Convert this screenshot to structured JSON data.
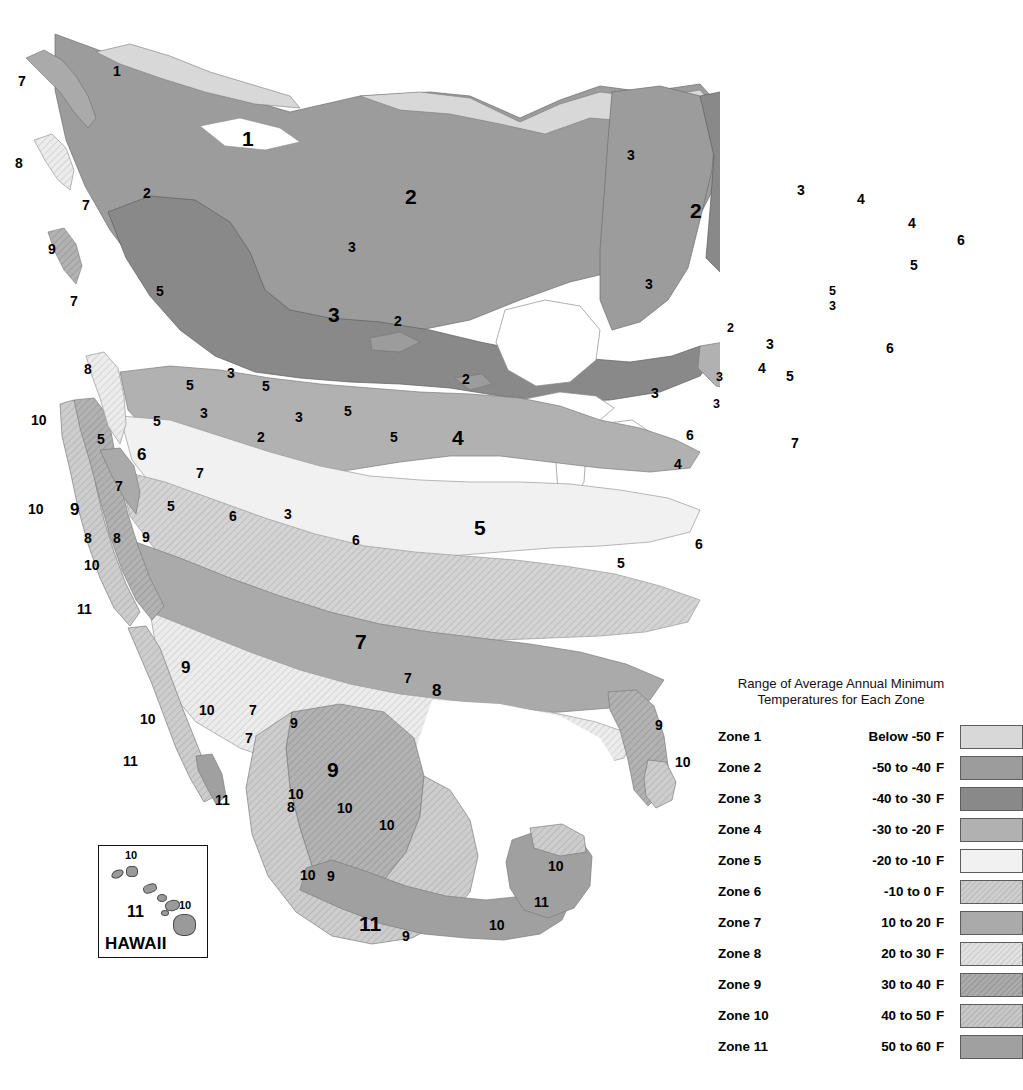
{
  "document": {
    "type": "usda-plant-hardiness-zone-map",
    "region": "North America"
  },
  "legend": {
    "title_line1": "Range of Average Annual Minimum",
    "title_line2": "Temperatures for Each Zone",
    "unit": "F",
    "rows": [
      {
        "zone": "Zone 1",
        "range": "Below -50",
        "unit": "F",
        "color": "#d8d8d8",
        "hatch": false
      },
      {
        "zone": "Zone 2",
        "range": "-50  to -40",
        "unit": "F",
        "color": "#9c9c9c",
        "hatch": false
      },
      {
        "zone": "Zone 3",
        "range": "-40  to -30",
        "unit": "F",
        "color": "#898989",
        "hatch": false
      },
      {
        "zone": "Zone 4",
        "range": "-30  to -20",
        "unit": "F",
        "color": "#b1b1b1",
        "hatch": false
      },
      {
        "zone": "Zone 5",
        "range": "-20  to -10",
        "unit": "F",
        "color": "#f1f1f1",
        "hatch": false
      },
      {
        "zone": "Zone 6",
        "range": "-10  to 0",
        "unit": "F",
        "color": "#cfcfcf",
        "hatch": true
      },
      {
        "zone": "Zone 7",
        "range": "10  to 20",
        "unit": "F",
        "color": "#aaaaaa",
        "hatch": false
      },
      {
        "zone": "Zone 8",
        "range": "20  to 30",
        "unit": "F",
        "color": "#e2e2e2",
        "hatch": true
      },
      {
        "zone": "Zone 9",
        "range": "30  to 40",
        "unit": "F",
        "color": "#acacac",
        "hatch": true
      },
      {
        "zone": "Zone 10",
        "range": "40  to 50",
        "unit": "F",
        "color": "#c8c8c8",
        "hatch": true
      },
      {
        "zone": "Zone 11",
        "range": "50  to 60",
        "unit": "F",
        "color": "#a0a0a0",
        "hatch": false
      }
    ]
  },
  "hawaii_inset": {
    "title": "HAWAII",
    "labels": [
      {
        "text": "10",
        "x": 26,
        "y": 4
      },
      {
        "text": "11",
        "x": 28,
        "y": 58
      },
      {
        "text": "10",
        "x": 80,
        "y": 54
      }
    ]
  },
  "map_labels": [
    {
      "text": "7",
      "x": 18,
      "y": 74,
      "size": "md"
    },
    {
      "text": "1",
      "x": 113,
      "y": 64,
      "size": "md"
    },
    {
      "text": "1",
      "x": 242,
      "y": 128,
      "size": "xl"
    },
    {
      "text": "8",
      "x": 15,
      "y": 156,
      "size": "md"
    },
    {
      "text": "2",
      "x": 143,
      "y": 186,
      "size": "md"
    },
    {
      "text": "2",
      "x": 405,
      "y": 186,
      "size": "xl"
    },
    {
      "text": "7",
      "x": 82,
      "y": 198,
      "size": "md"
    },
    {
      "text": "3",
      "x": 627,
      "y": 148,
      "size": "md"
    },
    {
      "text": "2",
      "x": 690,
      "y": 200,
      "size": "xl"
    },
    {
      "text": "3",
      "x": 797,
      "y": 183,
      "size": "md"
    },
    {
      "text": "4",
      "x": 857,
      "y": 192,
      "size": "md"
    },
    {
      "text": "9",
      "x": 48,
      "y": 242,
      "size": "md"
    },
    {
      "text": "4",
      "x": 908,
      "y": 216,
      "size": "md"
    },
    {
      "text": "6",
      "x": 957,
      "y": 233,
      "size": "md"
    },
    {
      "text": "3",
      "x": 348,
      "y": 240,
      "size": "md"
    },
    {
      "text": "5",
      "x": 910,
      "y": 258,
      "size": "md"
    },
    {
      "text": "3",
      "x": 645,
      "y": 277,
      "size": "md"
    },
    {
      "text": "7",
      "x": 70,
      "y": 294,
      "size": "md"
    },
    {
      "text": "5",
      "x": 156,
      "y": 284,
      "size": "md"
    },
    {
      "text": "3",
      "x": 328,
      "y": 304,
      "size": "xl"
    },
    {
      "text": "5",
      "x": 829,
      "y": 285,
      "size": "sm"
    },
    {
      "text": "3",
      "x": 829,
      "y": 300,
      "size": "sm"
    },
    {
      "text": "2",
      "x": 394,
      "y": 314,
      "size": "md"
    },
    {
      "text": "2",
      "x": 727,
      "y": 322,
      "size": "sm"
    },
    {
      "text": "3",
      "x": 766,
      "y": 337,
      "size": "md"
    },
    {
      "text": "6",
      "x": 886,
      "y": 341,
      "size": "md"
    },
    {
      "text": "8",
      "x": 84,
      "y": 362,
      "size": "md"
    },
    {
      "text": "3",
      "x": 227,
      "y": 366,
      "size": "md"
    },
    {
      "text": "5",
      "x": 186,
      "y": 378,
      "size": "md"
    },
    {
      "text": "5",
      "x": 262,
      "y": 379,
      "size": "md"
    },
    {
      "text": "2",
      "x": 462,
      "y": 372,
      "size": "md"
    },
    {
      "text": "3",
      "x": 651,
      "y": 386,
      "size": "md"
    },
    {
      "text": "3",
      "x": 716,
      "y": 371,
      "size": "sm"
    },
    {
      "text": "4",
      "x": 758,
      "y": 361,
      "size": "md"
    },
    {
      "text": "5",
      "x": 786,
      "y": 369,
      "size": "md"
    },
    {
      "text": "3",
      "x": 713,
      "y": 398,
      "size": "sm"
    },
    {
      "text": "5",
      "x": 153,
      "y": 414,
      "size": "md"
    },
    {
      "text": "3",
      "x": 200,
      "y": 406,
      "size": "md"
    },
    {
      "text": "3",
      "x": 295,
      "y": 410,
      "size": "md"
    },
    {
      "text": "5",
      "x": 344,
      "y": 404,
      "size": "md"
    },
    {
      "text": "10",
      "x": 31,
      "y": 413,
      "size": "md"
    },
    {
      "text": "4",
      "x": 452,
      "y": 427,
      "size": "xl"
    },
    {
      "text": "6",
      "x": 686,
      "y": 428,
      "size": "md"
    },
    {
      "text": "7",
      "x": 791,
      "y": 436,
      "size": "md"
    },
    {
      "text": "5",
      "x": 97,
      "y": 432,
      "size": "md"
    },
    {
      "text": "6",
      "x": 137,
      "y": 446,
      "size": "lg"
    },
    {
      "text": "2",
      "x": 257,
      "y": 430,
      "size": "md"
    },
    {
      "text": "5",
      "x": 390,
      "y": 430,
      "size": "md"
    },
    {
      "text": "4",
      "x": 674,
      "y": 457,
      "size": "md"
    },
    {
      "text": "7",
      "x": 115,
      "y": 479,
      "size": "md"
    },
    {
      "text": "7",
      "x": 196,
      "y": 466,
      "size": "md"
    },
    {
      "text": "5",
      "x": 167,
      "y": 499,
      "size": "md"
    },
    {
      "text": "10",
      "x": 28,
      "y": 502,
      "size": "md"
    },
    {
      "text": "9",
      "x": 70,
      "y": 501,
      "size": "lg"
    },
    {
      "text": "6",
      "x": 229,
      "y": 509,
      "size": "md"
    },
    {
      "text": "3",
      "x": 284,
      "y": 507,
      "size": "md"
    },
    {
      "text": "5",
      "x": 474,
      "y": 517,
      "size": "xl"
    },
    {
      "text": "6",
      "x": 352,
      "y": 533,
      "size": "md"
    },
    {
      "text": "6",
      "x": 695,
      "y": 537,
      "size": "md"
    },
    {
      "text": "8",
      "x": 84,
      "y": 531,
      "size": "md"
    },
    {
      "text": "8",
      "x": 113,
      "y": 531,
      "size": "md"
    },
    {
      "text": "9",
      "x": 142,
      "y": 530,
      "size": "md"
    },
    {
      "text": "5",
      "x": 617,
      "y": 556,
      "size": "md"
    },
    {
      "text": "10",
      "x": 84,
      "y": 558,
      "size": "md"
    },
    {
      "text": "11",
      "x": 77,
      "y": 602,
      "size": "md"
    },
    {
      "text": "7",
      "x": 355,
      "y": 631,
      "size": "xl"
    },
    {
      "text": "7",
      "x": 404,
      "y": 671,
      "size": "md"
    },
    {
      "text": "8",
      "x": 432,
      "y": 682,
      "size": "lg"
    },
    {
      "text": "9",
      "x": 181,
      "y": 659,
      "size": "lg"
    },
    {
      "text": "9",
      "x": 655,
      "y": 718,
      "size": "md"
    },
    {
      "text": "10",
      "x": 140,
      "y": 712,
      "size": "md"
    },
    {
      "text": "7",
      "x": 249,
      "y": 703,
      "size": "md"
    },
    {
      "text": "10",
      "x": 199,
      "y": 703,
      "size": "md"
    },
    {
      "text": "9",
      "x": 290,
      "y": 716,
      "size": "md"
    },
    {
      "text": "10",
      "x": 675,
      "y": 755,
      "size": "md"
    },
    {
      "text": "7",
      "x": 245,
      "y": 731,
      "size": "md"
    },
    {
      "text": "11",
      "x": 123,
      "y": 754,
      "size": "md"
    },
    {
      "text": "9",
      "x": 327,
      "y": 759,
      "size": "xl"
    },
    {
      "text": "10",
      "x": 288,
      "y": 787,
      "size": "md"
    },
    {
      "text": "8",
      "x": 287,
      "y": 800,
      "size": "md"
    },
    {
      "text": "10",
      "x": 337,
      "y": 801,
      "size": "md"
    },
    {
      "text": "11",
      "x": 215,
      "y": 793,
      "size": "md"
    },
    {
      "text": "10",
      "x": 379,
      "y": 818,
      "size": "md"
    },
    {
      "text": "10",
      "x": 300,
      "y": 868,
      "size": "md"
    },
    {
      "text": "9",
      "x": 327,
      "y": 869,
      "size": "md"
    },
    {
      "text": "10",
      "x": 548,
      "y": 859,
      "size": "md"
    },
    {
      "text": "11",
      "x": 534,
      "y": 895,
      "size": "md"
    },
    {
      "text": "11",
      "x": 359,
      "y": 913,
      "size": "xl"
    },
    {
      "text": "10",
      "x": 489,
      "y": 918,
      "size": "md"
    },
    {
      "text": "9",
      "x": 402,
      "y": 929,
      "size": "md"
    }
  ]
}
